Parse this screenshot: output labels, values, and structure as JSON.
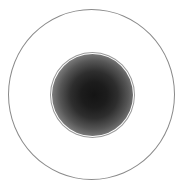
{
  "diagram": {
    "type": "concentric-circles",
    "outer_ring": {
      "center": [
        91.5,
        94.5
      ],
      "radius_x": 83.5,
      "radius_y": 85.5,
      "stroke_color": "#8a8a8a",
      "fill": "none"
    },
    "inner_disc": {
      "center": [
        92,
        94.5
      ],
      "radius": 42,
      "outline_color": "#9a9a9a",
      "gradient": {
        "type": "radial",
        "center_color": "#141414",
        "edge_color": "#c8c8c8"
      }
    },
    "background_color": "#ffffff"
  }
}
